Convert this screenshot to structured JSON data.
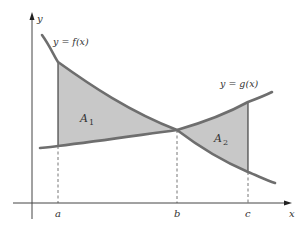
{
  "diagram": {
    "colors": {
      "curve": "#6e6e6e",
      "axis": "#444444",
      "shade": "#c8c8c8",
      "text": "#333333",
      "dashed": "#666666"
    },
    "axes": {
      "x_label": "x",
      "y_label": "y"
    },
    "curves": [
      {
        "name": "f",
        "label": "y = f(x)"
      },
      {
        "name": "g",
        "label": "y = g(x)"
      }
    ],
    "regions": [
      {
        "label_main": "A",
        "label_sub": "1",
        "from": "a",
        "to": "b"
      },
      {
        "label_main": "A",
        "label_sub": "2",
        "from": "b",
        "to": "c"
      }
    ],
    "x_ticks": [
      {
        "label": "a"
      },
      {
        "label": "b"
      },
      {
        "label": "c"
      }
    ]
  }
}
